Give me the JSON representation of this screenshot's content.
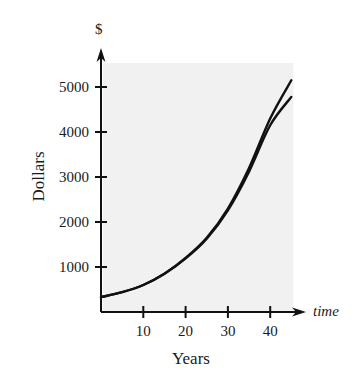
{
  "chart_data": {
    "type": "line",
    "title": "",
    "xlabel": "Years",
    "ylabel": "Dollars",
    "x_axis_arrow_label": "time",
    "y_axis_arrow_label": "$",
    "xlim": [
      0,
      45
    ],
    "ylim": [
      0,
      5500
    ],
    "x_ticks": [
      10,
      20,
      30,
      40
    ],
    "x_tick_labels": [
      "10",
      "20",
      "30",
      "40"
    ],
    "y_ticks": [
      1000,
      2000,
      3000,
      4000,
      5000
    ],
    "y_tick_labels": [
      "1000",
      "2000",
      "3000",
      "4000",
      "5000"
    ],
    "grid": false,
    "legend": null,
    "shaded_region": {
      "x": [
        0,
        45
      ],
      "y": [
        0,
        5500
      ],
      "color": "#f1f1f1"
    },
    "series": [
      {
        "name": "curve-upper",
        "x": [
          0,
          5,
          10,
          15,
          20,
          25,
          30,
          35,
          40,
          45
        ],
        "values": [
          330,
          440,
          600,
          850,
          1200,
          1650,
          2300,
          3200,
          4300,
          5150
        ]
      },
      {
        "name": "curve-lower",
        "x": [
          0,
          5,
          10,
          15,
          20,
          25,
          30,
          35,
          40,
          45
        ],
        "values": [
          330,
          440,
          600,
          850,
          1190,
          1630,
          2260,
          3120,
          4150,
          4780
        ]
      }
    ]
  },
  "colors": {
    "axis": "#111111",
    "curve": "#111111",
    "shade": "#f1f1f1"
  }
}
